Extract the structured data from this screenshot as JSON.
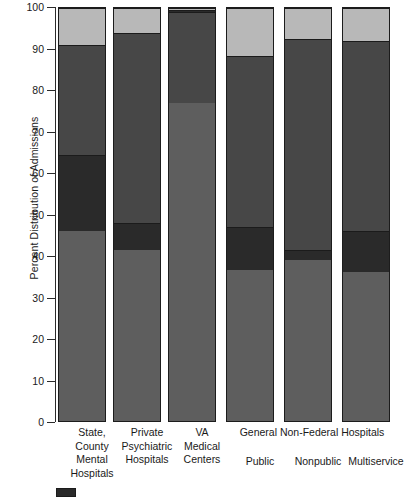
{
  "chart_data": {
    "type": "bar",
    "title": "",
    "xlabel": "",
    "ylabel": "Percent Distribution of Admissions",
    "ylim": [
      0,
      100
    ],
    "ytick_values": [
      0,
      10,
      20,
      30,
      40,
      50,
      60,
      70,
      80,
      90,
      100
    ],
    "ytick_labels": [
      "0",
      "10",
      "20",
      "30",
      "40",
      "50",
      "60",
      "70",
      "80",
      "90",
      "100"
    ],
    "grid": false,
    "stacked": true,
    "legend_position": "bottom-left",
    "categories": [
      "State, County Mental Hospitals",
      "Private Psychiatric Hospitals",
      "VA Medical Centers",
      "Public",
      "Nonpublic",
      "Multiservice"
    ],
    "category_lines": [
      [
        "State,",
        "County",
        "Mental",
        "Hospitals"
      ],
      [
        "Private",
        "Psychiatric",
        "Hospitals"
      ],
      [
        "VA",
        "Medical",
        "Centers"
      ],
      [
        "Public"
      ],
      [
        "Nonpublic"
      ],
      [
        "Multiservice"
      ]
    ],
    "group_label": "General Non-Federal Hospitals",
    "series": [
      {
        "name": "series-1",
        "color": "#5e5e5e",
        "values": [
          46.0,
          41.5,
          77.0,
          36.5,
          39.0,
          36.0
        ]
      },
      {
        "name": "series-2",
        "color": "#2a2a2a",
        "values": [
          18.5,
          6.5,
          0.0,
          10.5,
          2.5,
          10.0
        ]
      },
      {
        "name": "series-3",
        "color": "#474747",
        "values": [
          26.5,
          46.0,
          22.0,
          41.5,
          51.0,
          46.0
        ]
      },
      {
        "name": "series-4",
        "color": "#2a2a2a",
        "values": [
          0.0,
          0.0,
          0.6,
          0.0,
          0.0,
          0.0
        ]
      },
      {
        "name": "series-5",
        "color": "#b8b8b8",
        "values": [
          9.0,
          6.0,
          0.4,
          11.5,
          7.5,
          8.0
        ]
      }
    ],
    "segment_tops": [
      [
        46.0,
        64.5,
        91.0,
        91.0,
        100.0
      ],
      [
        41.5,
        48.0,
        94.0,
        94.0,
        100.0
      ],
      [
        77.0,
        77.0,
        99.0,
        99.6,
        100.0
      ],
      [
        36.5,
        47.0,
        88.5,
        88.5,
        100.0
      ],
      [
        39.0,
        41.5,
        92.5,
        92.5,
        100.0
      ],
      [
        36.0,
        46.0,
        92.0,
        92.0,
        100.0
      ]
    ]
  },
  "legend": {
    "items": [
      {
        "label": "",
        "color": "#2a2a2a"
      }
    ]
  }
}
